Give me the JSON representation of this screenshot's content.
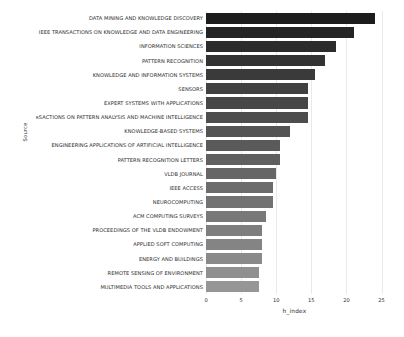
{
  "chart_data": {
    "type": "bar",
    "orientation": "horizontal",
    "title": "",
    "xlabel": "h_index",
    "ylabel": "Source",
    "xlim": [
      0,
      25.2
    ],
    "xticks": [
      0,
      5,
      10,
      15,
      20,
      25
    ],
    "xticklabels": [
      "0",
      "5",
      "10",
      "15",
      "20",
      "25"
    ],
    "grid": true,
    "grid_axis": "x",
    "legend": "none",
    "categories": [
      "DATA MINING AND KNOWLEDGE DISCOVERY",
      "IEEE TRANSACTIONS ON KNOWLEDGE AND DATA ENGINEERING",
      "INFORMATION SCIENCES",
      "PATTERN RECOGNITION",
      "KNOWLEDGE AND INFORMATION SYSTEMS",
      "SENSORS",
      "EXPERT SYSTEMS WITH APPLICATIONS",
      "ʀSACTIONS ON PATTERN ANALYSIS AND MACHINE INTELLIGENCE",
      "KNOWLEDGE-BASED SYSTEMS",
      "ENGINEERING APPLICATIONS OF ARTIFICIAL INTELLIGENCE",
      "PATTERN RECOGNITION LETTERS",
      "VLDB JOURNAL",
      "IEEE ACCESS",
      "NEUROCOMPUTING",
      "ACM COMPUTING SURVEYS",
      "PROCEEDINGS OF THE VLDB ENDOWMENT",
      "APPLIED SOFT COMPUTING",
      "ENERGY AND BUILDINGS",
      "REMOTE SENSING OF ENVIRONMENT",
      "MULTIMEDIA TOOLS AND APPLICATIONS"
    ],
    "values": [
      24,
      21,
      18.5,
      17,
      15.5,
      14.5,
      14.5,
      14.5,
      12,
      10.5,
      10.5,
      10,
      9.5,
      9.5,
      8.5,
      8,
      8,
      8,
      7.5,
      7.5
    ],
    "bar_colors": [
      "#1c1c1c",
      "#242424",
      "#2c2c2c",
      "#333333",
      "#3a3a3a",
      "#414141",
      "#474747",
      "#4d4d4d",
      "#545454",
      "#5a5a5a",
      "#606060",
      "#666666",
      "#6c6c6c",
      "#727272",
      "#787878",
      "#7e7e7e",
      "#848484",
      "#8a8a8a",
      "#909090",
      "#969696"
    ]
  }
}
